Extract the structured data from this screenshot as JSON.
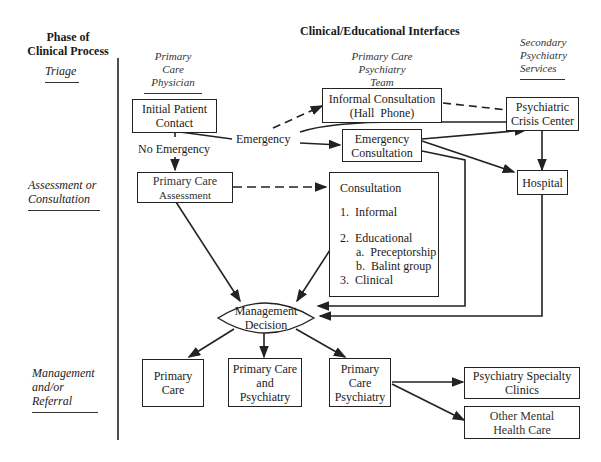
{
  "header": {
    "left_title": [
      "Phase of",
      "Clinical Process"
    ],
    "main_title": "Clinical/Educational Interfaces"
  },
  "columns": [
    {
      "label": [
        "Primary Care",
        "Physician"
      ]
    },
    {
      "label": [
        "Primary Care",
        "Psychiatry Team"
      ]
    },
    {
      "label": [
        "Secondary",
        "Psychiatry",
        "Services"
      ]
    }
  ],
  "phases": [
    {
      "label": [
        "Triage"
      ]
    },
    {
      "label": [
        "Assessment or",
        "Consultation"
      ]
    },
    {
      "label": [
        "Management",
        "and/or",
        "Referral"
      ]
    }
  ],
  "nodes": {
    "initial_contact": [
      "Initial Patient",
      "Contact"
    ],
    "informal_consultation": [
      "Informal Consultation",
      "(Hall  Phone)"
    ],
    "crisis_center": [
      "Psychiatric",
      "Crisis Center"
    ],
    "emergency_consultation": [
      "Emergency",
      "Consultation"
    ],
    "primary_assessment": [
      "Primary Care",
      "Assessment"
    ],
    "hospital": [
      "Hospital"
    ],
    "consultation": {
      "title": "Consultation",
      "items": [
        "1.  Informal",
        "2.  Educational",
        "a.  Preceptorship",
        "b.  Balint group",
        "3.  Clinical"
      ]
    },
    "management_decision": [
      "Management",
      "Decision"
    ],
    "primary_care": [
      "Primary",
      "Care"
    ],
    "primary_and_psychiatry": [
      "Primary Care",
      "and",
      "Psychiatry"
    ],
    "primary_care_psychiatry": [
      "Primary",
      "Care",
      "Psychiatry"
    ],
    "specialty_clinics": [
      "Psychiatry Specialty",
      "Clinics"
    ],
    "other_mental_health": [
      "Other Mental",
      "Health Care"
    ]
  },
  "edge_labels": {
    "emergency": "Emergency",
    "no_emergency": "No Emergency"
  }
}
